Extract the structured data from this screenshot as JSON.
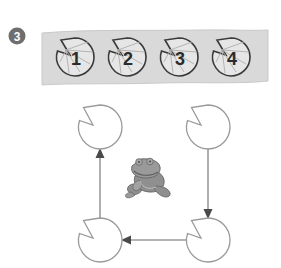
{
  "figure": {
    "panel_label": "3",
    "colors": {
      "background": "#ffffff",
      "badge_fill": "#6e6e6e",
      "badge_text": "#ffffff",
      "band_fill": "#d9d9d9",
      "band_edge": "#c2c2c2",
      "pad_top_outline": "#3a3a3a",
      "pad_top_fill": "#e3e3e3",
      "pad_vein": "#a8a8a8",
      "pad_number": "#2b2b2b",
      "pad_bottom_outline": "#9a9a9a",
      "pad_bottom_fill": "#ffffff",
      "arrow": "#8c8c8c",
      "arrow_head": "#4a4a4a",
      "frog_body": "#8f8f8f",
      "frog_outline": "#6a6a6a",
      "frog_shade": "#b5b5b5"
    }
  },
  "band": {
    "name": "lily-pad-strip",
    "pads": [
      {
        "label": "1",
        "cx": 75,
        "cy": 57,
        "r": 19
      },
      {
        "label": "2",
        "cx": 127,
        "cy": 57,
        "r": 19
      },
      {
        "label": "3",
        "cx": 179,
        "cy": 57,
        "r": 19
      },
      {
        "label": "4",
        "cx": 231,
        "cy": 57,
        "r": 19
      }
    ]
  },
  "cycle": {
    "name": "lily-pad-cycle",
    "nodes": [
      {
        "id": "top-left",
        "cx": 100,
        "cy": 127,
        "r": 22
      },
      {
        "id": "top-right",
        "cx": 208,
        "cy": 127,
        "r": 22
      },
      {
        "id": "bottom-left",
        "cx": 100,
        "cy": 240,
        "r": 22
      },
      {
        "id": "bottom-right",
        "cx": 208,
        "cy": 240,
        "r": 22
      }
    ],
    "arrows": [
      {
        "id": "bottom-left-to-top-left",
        "direction": "up"
      },
      {
        "id": "top-right-to-bottom-right",
        "direction": "down"
      },
      {
        "id": "bottom-right-to-bottom-left",
        "direction": "left"
      }
    ]
  },
  "frog": {
    "name": "frog-figure",
    "cx": 148,
    "cy": 178,
    "facing": "right"
  }
}
